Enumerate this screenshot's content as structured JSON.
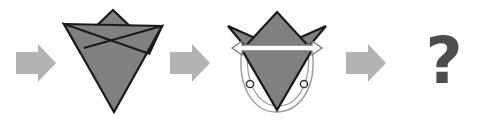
{
  "diagram": {
    "background_color": "#ffffff",
    "steps": [
      {
        "id": "step-arrow-1",
        "kind": "process-arrow",
        "label": "➡",
        "semantic": "right-arrow-icon",
        "color": "#b3b3b3"
      },
      {
        "id": "step-shape-1",
        "kind": "folded-figure",
        "label": "Folded paper figure with crown top and inverted triangle body",
        "fill_color": "#808080",
        "stroke_color": "#1a1a1a"
      },
      {
        "id": "step-arrow-2",
        "kind": "process-arrow",
        "label": "➡",
        "semantic": "right-arrow-icon",
        "color": "#b3b3b3"
      },
      {
        "id": "step-shape-2",
        "kind": "folded-figure-with-rotation",
        "label": "Folded paper figure with horizontal rotation axis and rotation arcs",
        "fill_color": "#808080",
        "stroke_color": "#1a1a1a",
        "axis_arrow_fill": "#ffffff",
        "axis_arrow_stroke": "#7a7a7a",
        "arc_stroke": "#9a9a9a",
        "pivot_marker_stroke": "#333333"
      },
      {
        "id": "step-arrow-3",
        "kind": "process-arrow",
        "label": "➡",
        "semantic": "right-arrow-icon",
        "color": "#b3b3b3"
      },
      {
        "id": "step-question",
        "kind": "unknown-result",
        "label": "?",
        "semantic": "question-mark-glyph",
        "color": "#4d4d4d"
      }
    ],
    "annotations": {
      "axis_arrow_name": "double-headed-horizontal-arrow",
      "left_pivot_name": "left-pivot-circle",
      "right_pivot_name": "right-pivot-circle",
      "left_arc_name": "left-rotation-arc",
      "right_arc_name": "right-rotation-arc"
    }
  }
}
